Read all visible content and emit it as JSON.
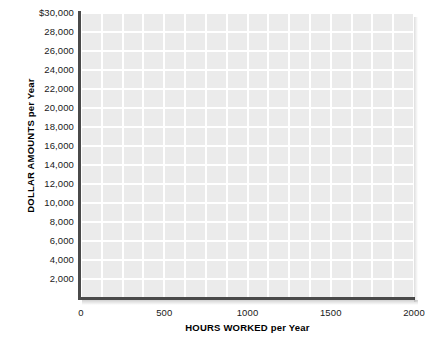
{
  "chart_data": {
    "type": "line",
    "title": "",
    "subtitle": "",
    "series": [],
    "data_points": [],
    "xlabel_upper": "HOURS WORKED",
    "xlabel_suffix": "per Year",
    "xlabel": "HOURS WORKED per Year",
    "ylabel_upper": "DOLLAR AMOUNTS",
    "ylabel_suffix": "per Year",
    "ylabel": "DOLLAR AMOUNTS per Year",
    "xlim": [
      0,
      2000
    ],
    "ylim": [
      0,
      30000
    ],
    "x_ticks": [
      0,
      500,
      1000,
      1500,
      2000
    ],
    "x_tick_labels": [
      "0",
      "500",
      "1000",
      "1500",
      "2000"
    ],
    "y_ticks": [
      2000,
      4000,
      6000,
      8000,
      10000,
      12000,
      14000,
      16000,
      18000,
      20000,
      22000,
      24000,
      26000,
      28000,
      30000
    ],
    "y_tick_labels": [
      "2,000",
      "4,000",
      "6,000",
      "8,000",
      "10,000",
      "12,000",
      "14,000",
      "16,000",
      "18,000",
      "20,000",
      "22,000",
      "24,000",
      "26,000",
      "28,000",
      "$30,000"
    ],
    "grid": true,
    "grid_minor_x_step": 125,
    "grid_minor_y_step": 2000,
    "legend": null,
    "legend_position": "none",
    "annotations": [],
    "colors": {
      "plot_background": "#ebebeb",
      "gridline": "#ffffff",
      "axis_line": "#4a4a4a",
      "tick_label": "#1a1a1a",
      "axis_title": "#000000",
      "canvas_background": "#ffffff"
    }
  }
}
